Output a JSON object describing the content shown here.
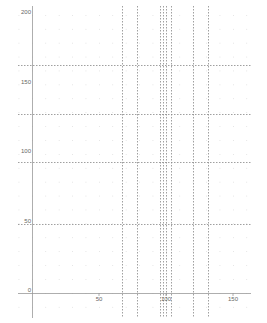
{
  "chart_data": {
    "type": "line",
    "title": "",
    "xlabel": "",
    "ylabel": "",
    "xlim": [
      -10,
      165
    ],
    "ylim": [
      -20,
      205
    ],
    "grid": true,
    "grid_style": "dotted",
    "x_ticks": [
      0,
      50,
      100,
      150
    ],
    "x_tick_labels": [
      "0",
      "50",
      "100",
      "150"
    ],
    "y_ticks": [
      0,
      50,
      100,
      150,
      200
    ],
    "y_tick_labels": [
      "0",
      "50",
      "100",
      "150",
      "200"
    ],
    "vertical_lines": [
      67,
      78,
      95.5,
      98,
      100,
      104,
      120,
      131
    ],
    "horizontal_lines": [
      50,
      94,
      129,
      164
    ],
    "line_style": "dashed",
    "line_color": "#888888"
  },
  "colors": {
    "axis": "#999999",
    "grid_dots": "#cccccc",
    "ref_lines": "#888888",
    "label": "#666666"
  }
}
